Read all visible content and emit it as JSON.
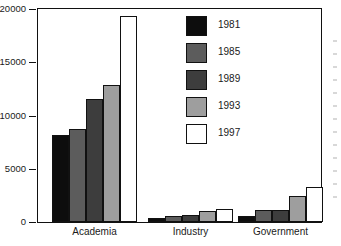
{
  "chart_data": {
    "type": "bar",
    "title": "",
    "xlabel": "",
    "ylabel": "",
    "categories": [
      "Academia",
      "Industry",
      "Government"
    ],
    "series": [
      {
        "name": "1981",
        "color": "#0d0d0d",
        "values": [
          8200,
          400,
          600
        ]
      },
      {
        "name": "1985",
        "color": "#5c5c5c",
        "values": [
          8750,
          550,
          1100
        ]
      },
      {
        "name": "1989",
        "color": "#3d3d3d",
        "values": [
          11550,
          650,
          1100
        ]
      },
      {
        "name": "1993",
        "color": "#9e9e9e",
        "values": [
          12900,
          1000,
          2400
        ]
      },
      {
        "name": "1997",
        "color": "#ffffff",
        "values": [
          19300,
          1250,
          3250
        ]
      }
    ],
    "ylim": [
      0,
      20000
    ],
    "yticks": [
      0,
      5000,
      10000,
      15000,
      20000
    ],
    "ytick_labels": [
      "0",
      "5000",
      "10000",
      "15000",
      "20000"
    ],
    "grid": false,
    "legend_position": "inside-top-center",
    "frame": true,
    "bar_edge_color": "#111111"
  },
  "legend": {
    "entries": [
      "1981",
      "1985",
      "1989",
      "1993",
      "1997"
    ]
  }
}
